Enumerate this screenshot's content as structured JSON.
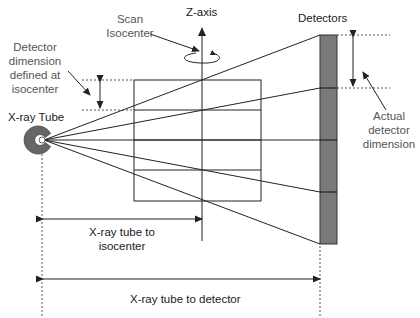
{
  "labels": {
    "z_axis": "Z-axis",
    "detectors": "Detectors",
    "scan_isocenter_line1": "Scan",
    "scan_isocenter_line2": "Isocenter",
    "detector_dim_line1": "Detector",
    "detector_dim_line2": "dimension",
    "detector_dim_line3": "defined at",
    "detector_dim_line4": "isocenter",
    "xray_tube": "X-ray Tube",
    "actual_line1": "Actual",
    "actual_line2": "detector",
    "actual_line3": "dimension",
    "tube_to_iso_line1": "X-ray tube to",
    "tube_to_iso_line2": "isocenter",
    "tube_to_detector": "X-ray tube to detector"
  },
  "colors": {
    "line": "#222222",
    "detector_fill": "#7a7a7a",
    "tube_fill": "#666666",
    "dashed": "#555555"
  },
  "geometry": {
    "detector_segments": 4,
    "isocenter_box_rows": 4
  }
}
